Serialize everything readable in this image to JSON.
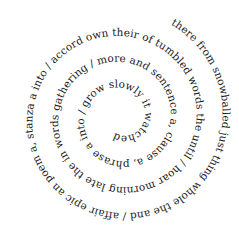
{
  "poem": {
    "text": "there from snowballed just thing whole the and / affair epic an poem a, stanza a into / accord own their of tumbled words the until / hoar morning late the in words gathering / more and sentence a, clause a, phrase a into / grow slowly it watched and / snow the through rolled | which / word the was beginning the in",
    "layout": "spiral",
    "direction": "outer-to-inner, clockwise",
    "text_color": "#1a1a1a",
    "background_color": "#ffffff"
  }
}
